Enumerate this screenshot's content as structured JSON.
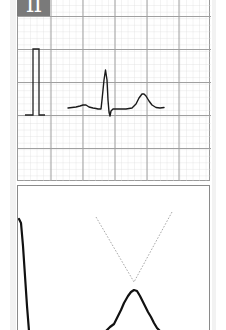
{
  "lead": {
    "label": "II",
    "label_bg": "#7a7a7a",
    "label_color": "#ffffff"
  },
  "ecg_strip": {
    "grid": {
      "major_spacing_px": 32.5,
      "minor_per_major": 5,
      "major_color": "#9a9a9a",
      "minor_color": "#dcdcdc"
    },
    "calibration_pulse": "standard 1 mV rectangular pulse",
    "waveform": [
      "P wave",
      "QRS complex",
      "T wave"
    ],
    "trace_color": "#1a1a1a"
  },
  "t_wave_detail": {
    "description": "magnified T wave with dotted tangent lines intersecting at apex",
    "tangent_color": "#9a9a9a",
    "trace_color": "#111111"
  }
}
